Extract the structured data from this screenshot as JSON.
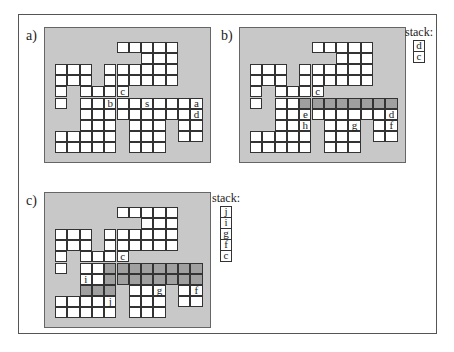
{
  "figure": {
    "panels": [
      {
        "id": "a",
        "label": "a)",
        "shaded": [],
        "labels": [
          {
            "text": "c",
            "r": 4,
            "c": 5
          },
          {
            "text": "b",
            "r": 5,
            "c": 4
          },
          {
            "text": "s",
            "r": 5,
            "c": 7
          },
          {
            "text": "a",
            "r": 5,
            "c": 11
          },
          {
            "text": "d",
            "r": 6,
            "c": 11
          }
        ],
        "stack": null
      },
      {
        "id": "b",
        "label": "b)",
        "shaded": [
          [
            5,
            4
          ],
          [
            5,
            5
          ],
          [
            5,
            6
          ],
          [
            5,
            7
          ],
          [
            5,
            8
          ],
          [
            5,
            9
          ],
          [
            5,
            10
          ],
          [
            5,
            11
          ]
        ],
        "labels": [
          {
            "text": "c",
            "r": 4,
            "c": 5
          },
          {
            "text": "e",
            "r": 6,
            "c": 4
          },
          {
            "text": "d",
            "r": 6,
            "c": 11
          },
          {
            "text": "h",
            "r": 7,
            "c": 4
          },
          {
            "text": "g",
            "r": 7,
            "c": 8
          },
          {
            "text": "f",
            "r": 7,
            "c": 11
          }
        ],
        "stack": {
          "label": "stack:",
          "items": [
            "d",
            "c"
          ]
        }
      },
      {
        "id": "c",
        "label": "c)",
        "shaded": [
          [
            5,
            4
          ],
          [
            5,
            5
          ],
          [
            5,
            6
          ],
          [
            5,
            7
          ],
          [
            5,
            8
          ],
          [
            5,
            9
          ],
          [
            5,
            10
          ],
          [
            5,
            11
          ],
          [
            6,
            4
          ],
          [
            6,
            5
          ],
          [
            6,
            6
          ],
          [
            6,
            7
          ],
          [
            6,
            8
          ],
          [
            6,
            9
          ],
          [
            6,
            10
          ],
          [
            6,
            11
          ],
          [
            7,
            2
          ],
          [
            7,
            3
          ],
          [
            7,
            4
          ]
        ],
        "labels": [
          {
            "text": "c",
            "r": 4,
            "c": 5
          },
          {
            "text": "i",
            "r": 6,
            "c": 2
          },
          {
            "text": "g",
            "r": 7,
            "c": 8
          },
          {
            "text": "f",
            "r": 7,
            "c": 11
          },
          {
            "text": "j",
            "r": 8,
            "c": 4
          }
        ],
        "stack": {
          "label": "stack:",
          "items": [
            "j",
            "i",
            "g",
            "f",
            "c"
          ]
        }
      }
    ],
    "maze_rows": [
      [
        5,
        6,
        7,
        8,
        9
      ],
      [
        7,
        8,
        9
      ],
      [
        0,
        1,
        2,
        4,
        5,
        6,
        7,
        8,
        9
      ],
      [
        0,
        1,
        2,
        4,
        5,
        6,
        7,
        8,
        9
      ],
      [
        0,
        2,
        3,
        4,
        5
      ],
      [
        0,
        2,
        3,
        4,
        5,
        6,
        7,
        8,
        9,
        10,
        11
      ],
      [
        2,
        3,
        4,
        5,
        6,
        7,
        8,
        9,
        10,
        11
      ],
      [
        2,
        3,
        4,
        6,
        7,
        8,
        10,
        11
      ],
      [
        0,
        1,
        2,
        3,
        4,
        6,
        7,
        8,
        10,
        11
      ],
      [
        0,
        1,
        2,
        3,
        4,
        6,
        7,
        8
      ]
    ],
    "colors": {
      "board": "#c8c8c8",
      "cell": "#ffffff",
      "shaded": "#a0a0a0"
    }
  }
}
